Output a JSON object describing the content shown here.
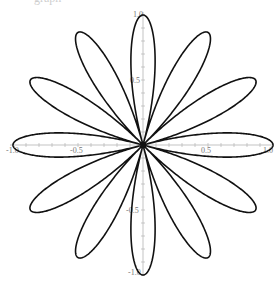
{
  "page": {
    "clipped_title": "graph"
  },
  "chart_data": {
    "type": "line",
    "subtype": "polar-rose",
    "title": "",
    "equation": "r = cos(6θ)",
    "petals": 12,
    "petal_angles_deg": [
      0,
      30,
      60,
      90,
      120,
      150,
      180,
      210,
      240,
      270,
      300,
      330
    ],
    "xlabel": "",
    "ylabel": "",
    "xlim": [
      -1.0,
      1.0
    ],
    "ylim": [
      -1.0,
      1.0
    ],
    "x_tick_labels": [
      "-1.0",
      "-0.5",
      "0.5",
      "1.0"
    ],
    "y_tick_labels": [
      "1.0",
      "0.5",
      "-0.5",
      "-1.0"
    ],
    "minor_tick_step": 0.1,
    "grid": false,
    "legend": null,
    "colors": {
      "curve": "#111111",
      "axis": "#b4b4b4",
      "labels": "#777777"
    }
  }
}
